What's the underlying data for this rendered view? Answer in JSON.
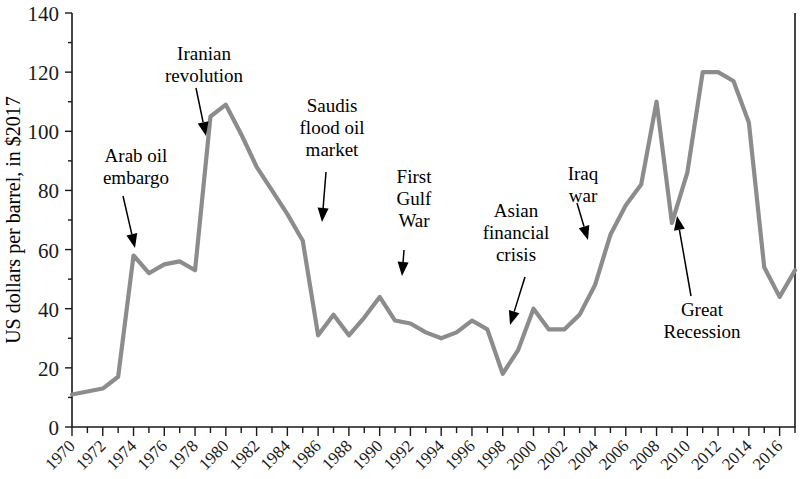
{
  "chart_data": {
    "type": "line",
    "title": "",
    "xlabel": "",
    "ylabel": "US dollars per barrel, in $2017",
    "ylim": [
      0,
      140
    ],
    "xlim": [
      1970,
      2017
    ],
    "yticks": [
      0,
      20,
      40,
      60,
      80,
      100,
      120,
      140
    ],
    "xticks": [
      1970,
      1972,
      1974,
      1976,
      1978,
      1980,
      1982,
      1984,
      1986,
      1988,
      1990,
      1992,
      1994,
      1996,
      1998,
      2000,
      2002,
      2004,
      2006,
      2008,
      2010,
      2012,
      2014,
      2016
    ],
    "grid": false,
    "legend": "none",
    "line_color": "#8c8c8c",
    "series": [
      {
        "name": "Crude oil price",
        "x": [
          1970,
          1971,
          1972,
          1973,
          1974,
          1975,
          1976,
          1977,
          1978,
          1979,
          1980,
          1981,
          1982,
          1983,
          1984,
          1985,
          1986,
          1987,
          1988,
          1989,
          1990,
          1991,
          1992,
          1993,
          1994,
          1995,
          1996,
          1997,
          1998,
          1999,
          2000,
          2001,
          2002,
          2003,
          2004,
          2005,
          2006,
          2007,
          2008,
          2009,
          2010,
          2011,
          2012,
          2013,
          2014,
          2015,
          2016,
          2017
        ],
        "values": [
          11,
          12,
          13,
          17,
          58,
          52,
          55,
          56,
          53,
          105,
          109,
          99,
          88,
          80,
          72,
          63,
          31,
          38,
          31,
          37,
          44,
          36,
          35,
          32,
          30,
          32,
          36,
          33,
          18,
          26,
          40,
          33,
          33,
          38,
          48,
          65,
          75,
          82,
          110,
          69,
          86,
          120,
          120,
          117,
          103,
          54,
          44,
          53
        ]
      }
    ],
    "annotations": [
      {
        "id": "arab-oil-embargo",
        "lines": [
          "Arab oil",
          "embargo"
        ],
        "text_x": 136,
        "text_y": 162,
        "arrow_from_x": 123,
        "arrow_from_y": 196,
        "arrow_to_x": 135,
        "arrow_to_y": 248,
        "arrow_dir": "down"
      },
      {
        "id": "iranian-revolution",
        "lines": [
          "Iranian",
          "revolution"
        ],
        "text_x": 204,
        "text_y": 60,
        "arrow_from_x": 196,
        "arrow_from_y": 88,
        "arrow_to_x": 206,
        "arrow_to_y": 136,
        "arrow_dir": "down"
      },
      {
        "id": "saudis-flood-oil-market",
        "lines": [
          "Saudis",
          "flood oil",
          "market"
        ],
        "text_x": 332,
        "text_y": 112,
        "arrow_from_x": 326,
        "arrow_from_y": 172,
        "arrow_to_x": 322,
        "arrow_to_y": 222,
        "arrow_dir": "down"
      },
      {
        "id": "first-gulf-war",
        "lines": [
          "First",
          "Gulf",
          "War"
        ],
        "text_x": 414,
        "text_y": 183,
        "arrow_from_x": 404,
        "arrow_from_y": 250,
        "arrow_to_x": 402,
        "arrow_to_y": 276,
        "arrow_dir": "down"
      },
      {
        "id": "asian-financial-crisis",
        "lines": [
          "Asian",
          "financial",
          "crisis"
        ],
        "text_x": 516,
        "text_y": 217,
        "arrow_from_x": 525,
        "arrow_from_y": 277,
        "arrow_to_x": 510,
        "arrow_to_y": 325,
        "arrow_dir": "down"
      },
      {
        "id": "iraq-war",
        "lines": [
          "Iraq",
          "war"
        ],
        "text_x": 583,
        "text_y": 180,
        "arrow_from_x": 577,
        "arrow_from_y": 203,
        "arrow_to_x": 588,
        "arrow_to_y": 240,
        "arrow_dir": "down"
      },
      {
        "id": "great-recession",
        "lines": [
          "Great",
          "Recession"
        ],
        "text_x": 702,
        "text_y": 316,
        "arrow_from_x": 691,
        "arrow_from_y": 296,
        "arrow_to_x": 677,
        "arrow_to_y": 216,
        "arrow_dir": "up"
      }
    ]
  }
}
